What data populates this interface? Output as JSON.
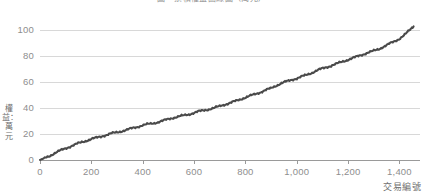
{
  "chart_data": {
    "type": "line",
    "title": "圖　累積權益曲線圖（萬元）",
    "xlabel": "交易編號",
    "ylabel": "權益：萬元",
    "xlim": [
      0,
      1480
    ],
    "ylim": [
      0,
      108
    ],
    "xticks": [
      0,
      200,
      400,
      600,
      800,
      1000,
      1200,
      1400
    ],
    "xticklabels": [
      "0",
      "200",
      "400",
      "600",
      "800",
      "1,000",
      "1,200",
      "1,400"
    ],
    "yticks": [
      0,
      20,
      40,
      60,
      80,
      100
    ],
    "yticklabels": [
      "0",
      "20",
      "40",
      "60",
      "80",
      "100"
    ],
    "grid": "horizontal",
    "legend": "none",
    "line_color": "#4a4a4a",
    "axis_color": "#9a9a9a",
    "grid_color": "#d8d8d8",
    "tick_label_color": "#8e8e8e",
    "series": [
      {
        "name": "累積權益",
        "x": [
          0,
          20,
          40,
          60,
          80,
          100,
          120,
          140,
          160,
          180,
          200,
          220,
          240,
          260,
          280,
          300,
          320,
          340,
          360,
          380,
          400,
          420,
          440,
          460,
          480,
          500,
          520,
          540,
          560,
          580,
          600,
          620,
          640,
          660,
          680,
          700,
          720,
          740,
          760,
          780,
          800,
          820,
          840,
          860,
          880,
          900,
          920,
          940,
          960,
          980,
          1000,
          1020,
          1040,
          1060,
          1080,
          1100,
          1120,
          1140,
          1160,
          1180,
          1200,
          1220,
          1240,
          1260,
          1280,
          1300,
          1320,
          1340,
          1360,
          1380,
          1400,
          1420,
          1440,
          1455
        ],
        "values": [
          0.0,
          1.6,
          3.4,
          5.6,
          7.4,
          9.0,
          10.6,
          12.2,
          13.6,
          14.8,
          16.2,
          17.2,
          18.3,
          19.4,
          20.6,
          21.4,
          22.3,
          23.4,
          24.6,
          25.6,
          26.8,
          27.6,
          28.3,
          29.2,
          30.4,
          31.6,
          32.6,
          33.5,
          34.4,
          35.2,
          36.4,
          37.6,
          38.4,
          39.2,
          40.2,
          41.6,
          42.8,
          44.0,
          45.4,
          46.8,
          48.2,
          49.6,
          51.0,
          52.4,
          54.0,
          55.4,
          57.4,
          59.2,
          60.6,
          61.8,
          63.0,
          64.4,
          65.8,
          67.4,
          69.2,
          70.6,
          71.8,
          73.2,
          74.6,
          76.0,
          77.4,
          78.8,
          80.2,
          81.6,
          83.0,
          84.2,
          85.6,
          87.6,
          89.6,
          91.4,
          93.6,
          96.6,
          100.2,
          103.0
        ]
      }
    ]
  }
}
